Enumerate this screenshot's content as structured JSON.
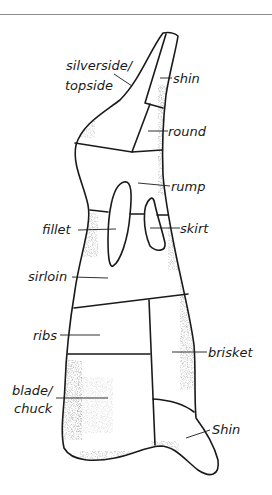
{
  "diagram": {
    "labels": {
      "silverside": "silverside/",
      "topside": "topside",
      "shin_top": "shin",
      "round": "round",
      "rump": "rump",
      "fillet": "fillet",
      "skirt": "skirt",
      "sirloin": "sirloin",
      "ribs": "ribs",
      "brisket": "brisket",
      "blade": "blade/",
      "chuck": "chuck",
      "shin_bottom": "Shin"
    },
    "colors": {
      "ink": "#1a1a1a",
      "rule": "#8a8a8a",
      "background": "#ffffff"
    }
  }
}
